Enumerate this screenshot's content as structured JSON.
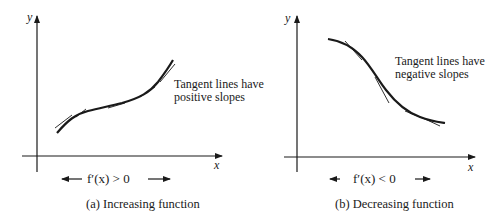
{
  "panels": [
    {
      "id": "a",
      "y_label": "y",
      "x_label": "x",
      "annotation_line1": "Tangent lines have",
      "annotation_line2": "positive slopes",
      "condition": "f′(x) > 0",
      "caption": "(a)  Increasing function"
    },
    {
      "id": "b",
      "y_label": "y",
      "x_label": "x",
      "annotation_line1": "Tangent lines have",
      "annotation_line2": "negative slopes",
      "condition": "f′(x) < 0",
      "caption": "(b)  Decreasing function"
    }
  ],
  "colors": {
    "ink": "#1a1a1a",
    "background": "#ffffff"
  }
}
